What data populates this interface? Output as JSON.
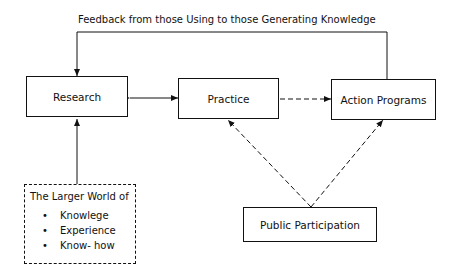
{
  "feedback_label": "Feedback from those Using to those Generating Knowledge",
  "nodes": {
    "research": "Research",
    "practice": "Practice",
    "action_programs": "Action Programs",
    "public_participation": "Public Participation",
    "larger_world": {
      "title": "The Larger World of",
      "items": [
        "Knowlege",
        "Experience",
        "Know- how"
      ]
    }
  }
}
